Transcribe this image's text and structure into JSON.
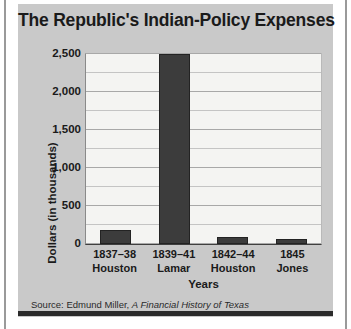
{
  "chart_data": {
    "type": "bar",
    "title": "The Republic's Indian-Policy Expenses",
    "xlabel": "Years",
    "ylabel": "Dollars (in thousands)",
    "categories": [
      "1837–38\nHouston",
      "1839–41\nLamar",
      "1842–44\nHouston",
      "1845\nJones"
    ],
    "category_parts": [
      {
        "years": "1837–38",
        "president": "Houston"
      },
      {
        "years": "1839–41",
        "president": "Lamar"
      },
      {
        "years": "1842–44",
        "president": "Houston"
      },
      {
        "years": "1845",
        "president": "Jones"
      }
    ],
    "values": [
      190,
      2500,
      90,
      65
    ],
    "ylim": [
      0,
      2500
    ],
    "ytick_labels": [
      "0",
      "500",
      "1,000",
      "1,500",
      "2,000",
      "2,500"
    ],
    "ytick_values": [
      0,
      500,
      1000,
      1500,
      2000,
      2500
    ],
    "minor_tick_interval": 250,
    "grid": true,
    "legend": "none",
    "bar_color": "#3c3c3c",
    "plot_background": "#f4f4f2",
    "panel_background": "#c9c9c9"
  },
  "source": {
    "prefix": "Source: Edmund Miller, ",
    "book_title": "A Financial History of Texas"
  }
}
